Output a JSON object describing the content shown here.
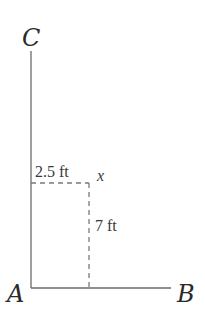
{
  "diagram": {
    "points": {
      "A": {
        "label": "A",
        "x": 31,
        "y": 288
      },
      "B": {
        "label": "B",
        "x": 171,
        "y": 288
      },
      "C": {
        "label": "C",
        "x": 31,
        "y": 51
      }
    },
    "dimensions": {
      "horizontal": "2.5 ft",
      "vertical": "7 ft"
    },
    "variable": "x",
    "colors": {
      "line": "#6b6b6b",
      "dashed": "#7a7a7a",
      "text": "#2a2a2a"
    }
  }
}
